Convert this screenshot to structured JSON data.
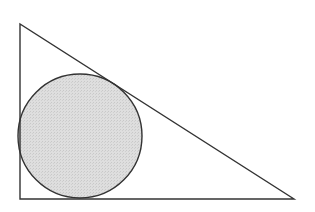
{
  "diagram": {
    "type": "geometry",
    "triangle": {
      "vertices": [
        [
          20,
          24
        ],
        [
          20,
          199
        ],
        [
          294,
          199
        ]
      ],
      "stroke": "#333333",
      "fill": "none"
    },
    "circle": {
      "cx": 80,
      "cy": 136,
      "r": 62,
      "fill": "#dcdcdc",
      "stroke": "#333333"
    },
    "colors": {
      "background": "#ffffff",
      "stroke": "#333333",
      "circle_fill": "#dcdcdc"
    }
  }
}
